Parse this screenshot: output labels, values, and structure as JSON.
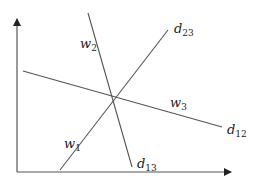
{
  "diagram": {
    "colors": {
      "line": "#555555",
      "axis": "#555555",
      "text": "#222222",
      "background": "#ffffff"
    },
    "axes": {
      "x_axis": {
        "from": [
          17,
          172
        ],
        "to": [
          232,
          172
        ],
        "arrow": true
      },
      "y_axis": {
        "from": [
          17,
          172
        ],
        "to": [
          17,
          18
        ],
        "arrow": true
      }
    },
    "lines": [
      {
        "id": "d13",
        "from": [
          88,
          13
        ],
        "to": [
          132,
          167
        ],
        "labels": [
          "w2",
          "d13"
        ]
      },
      {
        "id": "d23",
        "from": [
          60,
          170
        ],
        "to": [
          168,
          30
        ],
        "labels": [
          "w1",
          "d23"
        ]
      },
      {
        "id": "d12",
        "from": [
          23,
          71
        ],
        "to": [
          222,
          127
        ],
        "labels": [
          "w3",
          "d12"
        ]
      }
    ],
    "intersection": [
      113,
      99
    ],
    "labels": {
      "w2": {
        "base": "w",
        "sub": "2"
      },
      "d23": {
        "base": "d",
        "sub": "23"
      },
      "w1": {
        "base": "w",
        "sub": "1"
      },
      "w3": {
        "base": "w",
        "sub": "3"
      },
      "d12": {
        "base": "d",
        "sub": "12"
      },
      "d13": {
        "base": "d",
        "sub": "13"
      }
    }
  }
}
